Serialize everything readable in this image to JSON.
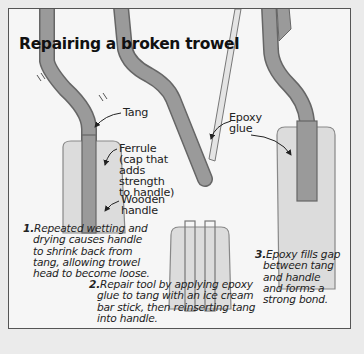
{
  "title": "Repairing a broken trowel",
  "labels": {
    "tang": "Tang",
    "ferrule": [
      "Ferrule",
      "(cap that",
      "adds",
      "strength",
      "to handle)"
    ],
    "wooden_handle": [
      "Wooden",
      "handle"
    ],
    "epoxy_glue": [
      "Epoxy",
      "glue"
    ]
  },
  "steps": [
    {
      "num": "1.",
      "lines": [
        "Repeated wetting and",
        "drying causes handle",
        "to shrink back from",
        "tang, allowing trowel",
        "head to become loose."
      ]
    },
    {
      "num": "2.",
      "lines": [
        "Repair tool by applying epoxy",
        "glue to tang with an ice cream",
        "bar stick, then reinserting tang",
        "into handle."
      ]
    },
    {
      "num": "3.",
      "lines": [
        "Epoxy fills gap",
        "between tang",
        "and handle",
        "and forms a",
        "strong bond."
      ]
    }
  ],
  "colors": {
    "tang": "#9a9a9a",
    "handle": "#dcdcdc",
    "outline": "#666666",
    "background": "#ebebeb",
    "panel": "#f6f6f6"
  }
}
